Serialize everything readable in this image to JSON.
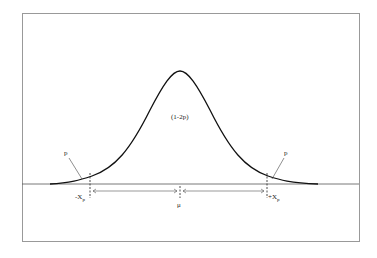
{
  "diagram": {
    "title": "",
    "center_label": "(1-2p)",
    "left_tail_label": "p",
    "right_tail_label": "p",
    "left_x_label": "-X",
    "left_x_sub": "p",
    "right_x_label": "+X",
    "right_x_sub": "p",
    "mean_label": "μ"
  }
}
